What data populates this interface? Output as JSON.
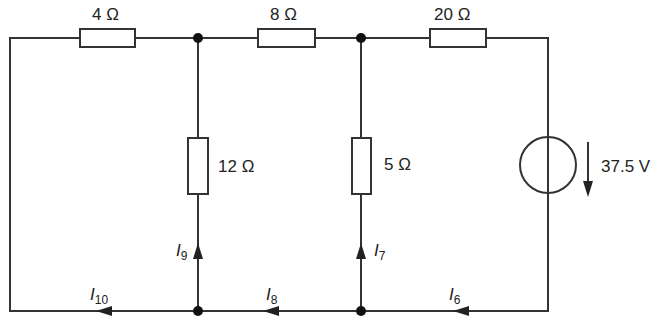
{
  "diagram": {
    "type": "circuit",
    "colors": {
      "line": "#333333",
      "node": "#111111",
      "text": "#222222",
      "background": "#ffffff"
    },
    "resistors": [
      {
        "id": "R1",
        "label": "4 Ω",
        "position": "top-left branch"
      },
      {
        "id": "R2",
        "label": "8 Ω",
        "position": "top-middle branch"
      },
      {
        "id": "R3",
        "label": "20 Ω",
        "position": "top-right branch"
      },
      {
        "id": "R4",
        "label": "12 Ω",
        "position": "left vertical branch"
      },
      {
        "id": "R5",
        "label": "5 Ω",
        "position": "right vertical branch"
      }
    ],
    "source": {
      "label": "37.5 V",
      "type": "voltage source",
      "arrow": "down"
    },
    "currents": [
      {
        "id": "I10",
        "main": "I",
        "sub": "10",
        "direction": "left"
      },
      {
        "id": "I9",
        "main": "I",
        "sub": "9",
        "direction": "up"
      },
      {
        "id": "I8",
        "main": "I",
        "sub": "8",
        "direction": "left"
      },
      {
        "id": "I7",
        "main": "I",
        "sub": "7",
        "direction": "up"
      },
      {
        "id": "I6",
        "main": "I",
        "sub": "6",
        "direction": "left"
      }
    ]
  }
}
